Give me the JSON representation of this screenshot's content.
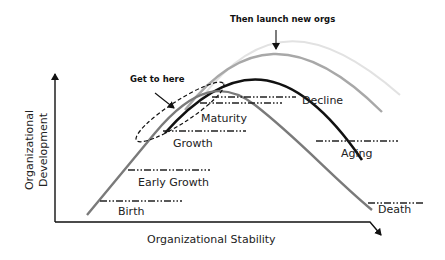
{
  "diagram": {
    "x_axis_label": "Organizational Stability",
    "y_axis_label_line1": "Organizational",
    "y_axis_label_line2": "Development",
    "stages": {
      "birth": "Birth",
      "early_growth": "Early Growth",
      "growth": "Growth",
      "maturity": "Maturity",
      "decline": "Decline",
      "aging": "Aging",
      "death": "Death"
    },
    "annotations": {
      "get_to_here": "Get to here",
      "then_launch": "Then launch new orgs"
    },
    "colors": {
      "main_curve": "#7a7a7a",
      "curve_2": "#111111",
      "curve_3": "#a8a8a8",
      "curve_4": "#e2e2e2",
      "axis": "#111111",
      "text": "#222222"
    }
  }
}
